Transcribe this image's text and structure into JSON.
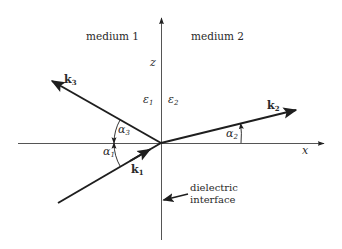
{
  "diagram": {
    "type": "wave-vector reflection/refraction at dielectric interface",
    "colors": {
      "ink": "#1e1e1e",
      "axis": "#555555",
      "background": "#ffffff"
    },
    "regions": [
      {
        "id": "medium-1",
        "label": "medium 1",
        "permittivity": "ε",
        "permittivity_sub": "1"
      },
      {
        "id": "medium-2",
        "label": "medium 2",
        "permittivity": "ε",
        "permittivity_sub": "2"
      }
    ],
    "axes": {
      "z": {
        "label": "z"
      },
      "x": {
        "label": "x"
      }
    },
    "vectors": [
      {
        "id": "k1",
        "label": "k",
        "sub": "1",
        "role": "incident"
      },
      {
        "id": "k2",
        "label": "k",
        "sub": "2",
        "role": "transmitted"
      },
      {
        "id": "k3",
        "label": "k",
        "sub": "3",
        "role": "reflected"
      }
    ],
    "angles": [
      {
        "id": "alpha1",
        "label": "α",
        "sub": "1"
      },
      {
        "id": "alpha2",
        "label": "α",
        "sub": "2"
      },
      {
        "id": "alpha3",
        "label": "α",
        "sub": "3"
      }
    ],
    "annotations": {
      "interface_line1": "dielectric",
      "interface_line2": "interface"
    }
  }
}
